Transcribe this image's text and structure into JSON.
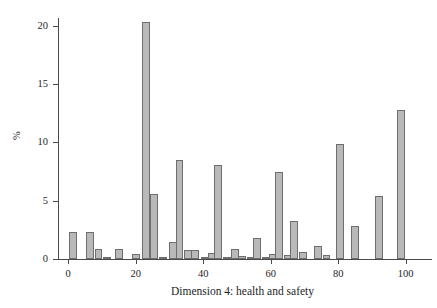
{
  "chart_data": {
    "type": "bar",
    "title": "",
    "subtitle": "",
    "xlabel": "Dimension 4: health and safety",
    "ylabel": "%",
    "xlim": [
      -3,
      106
    ],
    "ylim": [
      0,
      21
    ],
    "grid": false,
    "legend": null,
    "xticks": [
      0,
      20,
      40,
      60,
      80,
      100
    ],
    "xtick_labels": [
      "0",
      "20",
      "40",
      "60",
      "80",
      "100"
    ],
    "yticks": [
      0,
      5,
      10,
      15,
      20
    ],
    "ytick_labels": [
      "0",
      "5",
      "10",
      "15",
      "20"
    ],
    "bar_width": 2.3,
    "bar_fill": "#b9b9b9",
    "bar_stroke": "#6e6e6e",
    "axis_color": "#4a4a4a",
    "background": "#ffffff",
    "x": [
      1.5,
      6.5,
      9.0,
      11.5,
      15.0,
      20.0,
      23.0,
      25.5,
      28.0,
      31.0,
      33.0,
      35.5,
      37.5,
      40.5,
      42.5,
      44.5,
      47.0,
      49.5,
      51.5,
      54.0,
      56.0,
      58.5,
      60.5,
      62.5,
      65.0,
      67.0,
      69.5,
      74.0,
      76.5,
      80.5,
      85.0,
      92.0,
      98.5
    ],
    "values": [
      2.3,
      2.3,
      0.9,
      0.2,
      0.85,
      0.45,
      20.3,
      5.6,
      0.2,
      1.5,
      8.5,
      0.8,
      0.75,
      0.1,
      0.55,
      8.1,
      0.05,
      0.9,
      0.25,
      0.08,
      1.8,
      0.15,
      0.4,
      7.5,
      0.35,
      3.3,
      0.6,
      1.15,
      0.35,
      9.9,
      2.8,
      5.4,
      12.8
    ],
    "categories": [
      "1.5",
      "6.5",
      "9.0",
      "11.5",
      "15.0",
      "20.0",
      "23.0",
      "25.5",
      "28.0",
      "31.0",
      "33.0",
      "35.5",
      "37.5",
      "40.5",
      "42.5",
      "44.5",
      "47.0",
      "49.5",
      "51.5",
      "54.0",
      "56.0",
      "58.5",
      "60.5",
      "62.5",
      "65.0",
      "67.0",
      "69.5",
      "74.0",
      "76.5",
      "80.5",
      "85.0",
      "92.0",
      "98.5"
    ]
  }
}
